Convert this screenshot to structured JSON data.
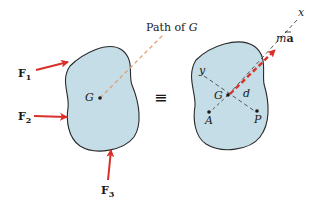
{
  "diagram": {
    "left_body": {
      "center_label": "G",
      "path_label": "Path of ",
      "path_label_var": "G",
      "forces": [
        {
          "label": "F",
          "sub": "1"
        },
        {
          "label": "F",
          "sub": "2"
        },
        {
          "label": "F",
          "sub": "3"
        }
      ]
    },
    "equivalence_symbol": "≡",
    "right_body": {
      "center_label": "G",
      "axis_x": "x",
      "axis_y": "y",
      "distance_label": "d",
      "point_a": "A",
      "point_p": "P",
      "inertia_vector_m": "m",
      "inertia_vector_a": "a"
    },
    "colors": {
      "body_fill": "#c5dde6",
      "body_stroke": "#2a2a2a",
      "force_arrow": "#d9302a",
      "path_line": "#e2a070",
      "axis_line": "#444444"
    }
  }
}
